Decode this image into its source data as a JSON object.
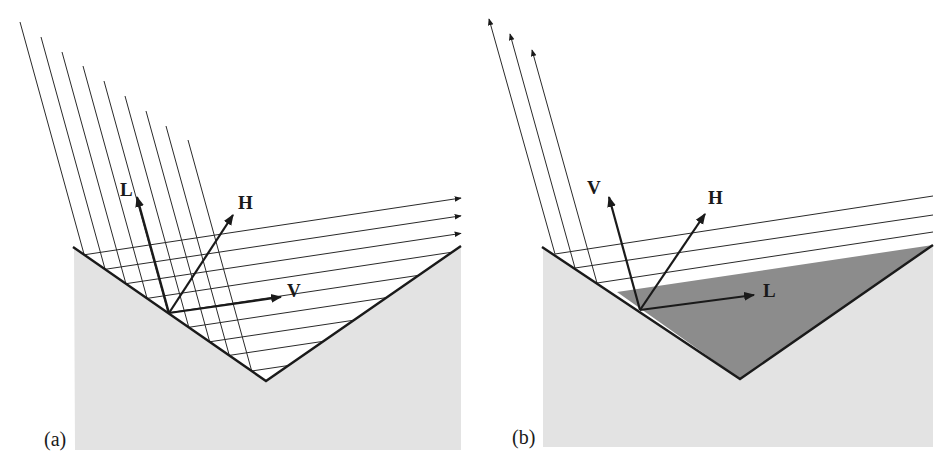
{
  "figure": {
    "colors": {
      "ground": "#e3e3e3",
      "shadow": "#8c8c8c",
      "lines": "#1a1a1a",
      "background": "#ffffff"
    }
  },
  "panels": [
    {
      "id": "a",
      "label": "(a)",
      "vectors": [
        {
          "name": "L",
          "label": "L"
        },
        {
          "name": "H",
          "label": "H"
        },
        {
          "name": "V",
          "label": "V"
        }
      ],
      "incoming_ray_count": 9,
      "reflected_ray_count": 9,
      "escaping_reflected_rays": 3
    },
    {
      "id": "b",
      "label": "(b)",
      "vectors": [
        {
          "name": "V",
          "label": "V"
        },
        {
          "name": "H",
          "label": "H"
        },
        {
          "name": "L",
          "label": "L"
        }
      ],
      "outgoing_ray_count": 3,
      "shadowed_region": true
    }
  ]
}
